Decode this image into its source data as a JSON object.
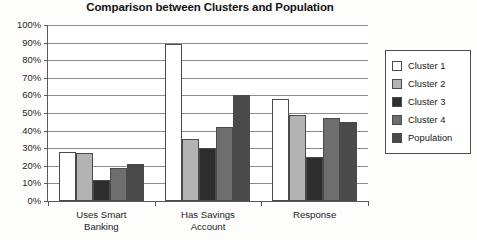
{
  "chart_data": {
    "type": "bar",
    "title": "Comparison between Clusters and Population",
    "xlabel": "",
    "ylabel": "",
    "ylim": [
      0,
      100
    ],
    "ytick_labels": [
      "100%",
      "90%",
      "80%",
      "70%",
      "60%",
      "50%",
      "40%",
      "30%",
      "20%",
      "10%",
      "0%"
    ],
    "ytick_values": [
      100,
      90,
      80,
      70,
      60,
      50,
      40,
      30,
      20,
      10,
      0
    ],
    "grid": true,
    "legend_position": "right",
    "categories": [
      "Uses Smart\nBanking",
      "Has Savings\nAccount",
      "Response"
    ],
    "series": [
      {
        "name": "Cluster 1",
        "color": "#ffffff",
        "values": [
          28,
          89,
          58
        ]
      },
      {
        "name": "Cluster 2",
        "color": "#b3b3b3",
        "values": [
          27,
          35,
          49
        ]
      },
      {
        "name": "Cluster 3",
        "color": "#2e2e2e",
        "values": [
          12,
          30,
          25
        ]
      },
      {
        "name": "Cluster 4",
        "color": "#6e6e6e",
        "values": [
          19,
          42,
          47
        ]
      },
      {
        "name": "Population",
        "color": "#4a4a4a",
        "values": [
          21,
          60,
          45
        ]
      }
    ]
  },
  "colors": {
    "axis": "#59595c",
    "gridline": "#8d8d90",
    "bar_outline": "#4a4a4d",
    "text": "#1a1a1a",
    "plot_background": "#ffffff",
    "figure_background": "#fdfdfc"
  }
}
